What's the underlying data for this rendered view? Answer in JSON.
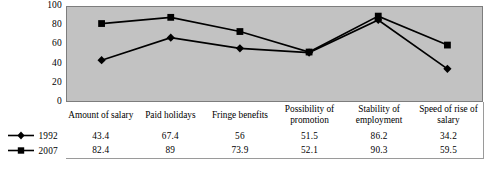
{
  "chart_data": {
    "type": "line",
    "title": "",
    "subtitle": "",
    "xlabel": "",
    "ylabel": "",
    "ylim": [
      0,
      100
    ],
    "yticks": [
      100,
      80,
      60,
      40,
      20,
      0
    ],
    "grid": false,
    "legend_position": "left-table",
    "categories": [
      "Amount of salary",
      "Paid holidays",
      "Fringe benefits",
      "Possibility of promotion",
      "Stability of employment",
      "Speed of rise of salary"
    ],
    "series": [
      {
        "name": "1992",
        "marker": "diamond",
        "color": "#000000",
        "values": [
          43.4,
          67.4,
          56,
          51.5,
          86.2,
          34.2
        ],
        "value_labels": [
          "43.4",
          "67.4",
          "56",
          "51.5",
          "86.2",
          "34.2"
        ]
      },
      {
        "name": "2007",
        "marker": "square",
        "color": "#000000",
        "values": [
          82.4,
          89,
          73.9,
          52.1,
          90.3,
          59.5
        ],
        "value_labels": [
          "82.4",
          "89",
          "73.9",
          "52.1",
          "90.3",
          "59.5"
        ]
      }
    ]
  },
  "table": {
    "header_row": [
      "Amount of salary",
      "Paid holidays",
      "Fringe benefits",
      "Possibility of promotion",
      "Stability of employment",
      "Speed of rise of salary"
    ],
    "rows": [
      {
        "label": "1992",
        "values": [
          "43.4",
          "67.4",
          "56",
          "51.5",
          "86.2",
          "34.2"
        ]
      },
      {
        "label": "2007",
        "values": [
          "82.4",
          "89",
          "73.9",
          "52.1",
          "90.3",
          "59.5"
        ]
      }
    ]
  },
  "colors": {
    "plot_background": "#c2c2c2",
    "plot_border": "#7d7d7d",
    "series_line": "#000000",
    "page_background": "#ffffff",
    "table_border": "#9a9a9a"
  }
}
